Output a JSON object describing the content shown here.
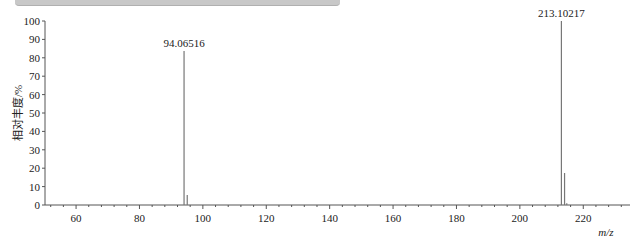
{
  "chart_data": {
    "type": "bar",
    "subtype": "mass-spectrum-stick",
    "title": "",
    "xlabel": "m/z",
    "ylabel": "相对丰度/%",
    "xlim": [
      50,
      234
    ],
    "ylim": [
      0,
      100
    ],
    "x_ticks": [
      60,
      80,
      100,
      120,
      140,
      160,
      180,
      200,
      220
    ],
    "y_ticks": [
      0,
      10,
      20,
      30,
      40,
      50,
      60,
      70,
      80,
      90,
      100
    ],
    "grid": false,
    "legend": null,
    "peaks": [
      {
        "mz": 94.06516,
        "intensity": 83.7,
        "label": "94.06516"
      },
      {
        "mz": 95.07,
        "intensity": 5.4,
        "label": ""
      },
      {
        "mz": 213.10217,
        "intensity": 100,
        "label": "213.10217"
      },
      {
        "mz": 214.1,
        "intensity": 17.4,
        "label": ""
      },
      {
        "mz": 214.8,
        "intensity": 1.0,
        "label": ""
      }
    ],
    "colors": {
      "peak": "#777777",
      "axis": "#555555",
      "text": "#222222"
    }
  },
  "labels": {
    "xlabel": "m/z",
    "ylabel": "相对丰度/%",
    "peak1": "94.06516",
    "peak2": "213.10217"
  }
}
